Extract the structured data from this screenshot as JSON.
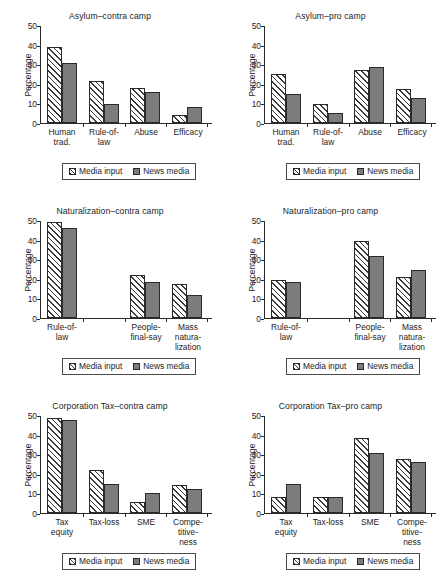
{
  "figure": {
    "ylabel": "Percentage",
    "yticks": [
      0,
      10,
      20,
      30,
      40,
      50
    ],
    "ylim": [
      0,
      50
    ],
    "legend": {
      "series1_label": "Media input",
      "series2_label": "News media",
      "series1_swatch": "hatched-swatch",
      "series2_swatch": "solid-gray-swatch"
    },
    "colors": {
      "hatch_line": "#3a3a3a",
      "solid_fill": "#7c7c7c",
      "axis": "#2a2a2a",
      "background": "#ffffff",
      "text": "#1c1c1c"
    }
  },
  "chart_data": [
    {
      "type": "bar",
      "title": "Asylum–contra camp",
      "xlabel": "",
      "ylabel": "Percentage",
      "ylim": [
        0,
        50
      ],
      "yticks": [
        0,
        10,
        20,
        30,
        40,
        50
      ],
      "grid": false,
      "legend_position": "below-axes",
      "categories": [
        "Human trad.",
        "Rule-of-law",
        "Abuse",
        "Efficacy"
      ],
      "category_lines": [
        [
          "Human",
          "trad."
        ],
        [
          "Rule-of-",
          "law"
        ],
        [
          "Abuse"
        ],
        [
          "Efficacy"
        ]
      ],
      "series": [
        {
          "name": "Media input",
          "values": [
            39.0,
            21.5,
            18.0,
            4.0
          ]
        },
        {
          "name": "News media",
          "values": [
            30.5,
            9.5,
            16.0,
            8.0
          ]
        }
      ]
    },
    {
      "type": "bar",
      "title": "Asylum–pro camp",
      "xlabel": "",
      "ylabel": "Percentage",
      "ylim": [
        0,
        50
      ],
      "yticks": [
        0,
        10,
        20,
        30,
        40,
        50
      ],
      "grid": false,
      "legend_position": "below-axes",
      "categories": [
        "Human trad.",
        "Rule-of-law",
        "Abuse",
        "Efficacy"
      ],
      "category_lines": [
        [
          "Human",
          "trad."
        ],
        [
          "Rule-of-",
          "law"
        ],
        [
          "Abuse"
        ],
        [
          "Efficacy"
        ]
      ],
      "series": [
        {
          "name": "Media input",
          "values": [
            25.0,
            9.5,
            27.0,
            17.5
          ]
        },
        {
          "name": "News media",
          "values": [
            15.0,
            5.0,
            28.5,
            13.0
          ]
        }
      ]
    },
    {
      "type": "bar",
      "title": "Naturalization–contra camp",
      "xlabel": "",
      "ylabel": "Percentage",
      "ylim": [
        0,
        50
      ],
      "yticks": [
        0,
        10,
        20,
        30,
        40,
        50
      ],
      "grid": false,
      "legend_position": "below-axes",
      "categories": [
        "Rule-of-law",
        "",
        "People-final-say",
        "Mass naturalization"
      ],
      "category_lines": [
        [
          "Rule-of-law"
        ],
        [
          ""
        ],
        [
          "People-",
          "final-say"
        ],
        [
          "Mass",
          "natura-",
          "lization"
        ]
      ],
      "series": [
        {
          "name": "Media input",
          "values": [
            49.0,
            null,
            22.0,
            17.5
          ]
        },
        {
          "name": "News media",
          "values": [
            46.0,
            null,
            18.5,
            11.5
          ]
        }
      ]
    },
    {
      "type": "bar",
      "title": "Naturalization–pro camp",
      "xlabel": "",
      "ylabel": "Percentage",
      "ylim": [
        0,
        50
      ],
      "yticks": [
        0,
        10,
        20,
        30,
        40,
        50
      ],
      "grid": false,
      "legend_position": "below-axes",
      "categories": [
        "Rule-of-law",
        "",
        "People-final-say",
        "Mass naturalization"
      ],
      "category_lines": [
        [
          "Rule-of-law"
        ],
        [
          ""
        ],
        [
          "People-",
          "final-say"
        ],
        [
          "Mass",
          "natura-",
          "lization"
        ]
      ],
      "series": [
        {
          "name": "Media input",
          "values": [
            19.5,
            null,
            39.5,
            21.0
          ]
        },
        {
          "name": "News media",
          "values": [
            18.5,
            null,
            31.5,
            24.5
          ]
        }
      ]
    },
    {
      "type": "bar",
      "title": "Corporation Tax–contra camp",
      "xlabel": "",
      "ylabel": "Percentage",
      "ylim": [
        0,
        50
      ],
      "yticks": [
        0,
        10,
        20,
        30,
        40,
        50
      ],
      "grid": false,
      "legend_position": "below-axes",
      "categories": [
        "Tax equity",
        "Tax-loss",
        "SME",
        "Competitiveness"
      ],
      "category_lines": [
        [
          "Tax",
          "equity"
        ],
        [
          "Tax-loss"
        ],
        [
          "SME"
        ],
        [
          "Compe-",
          "titive-",
          "ness"
        ]
      ],
      "series": [
        {
          "name": "Media input",
          "values": [
            48.5,
            22.0,
            5.5,
            14.5
          ]
        },
        {
          "name": "News media",
          "values": [
            47.5,
            15.0,
            10.0,
            12.0
          ]
        }
      ]
    },
    {
      "type": "bar",
      "title": "Corporation Tax–pro camp",
      "xlabel": "",
      "ylabel": "Percentage",
      "ylim": [
        0,
        50
      ],
      "yticks": [
        0,
        10,
        20,
        30,
        40,
        50
      ],
      "grid": false,
      "legend_position": "below-axes",
      "categories": [
        "Tax equity",
        "Tax-loss",
        "SME",
        "Competitiveness"
      ],
      "category_lines": [
        [
          "Tax",
          "equity"
        ],
        [
          "Tax-loss"
        ],
        [
          "SME"
        ],
        [
          "Compe-",
          "titive-",
          "ness"
        ]
      ],
      "series": [
        {
          "name": "Media input",
          "values": [
            8.0,
            8.0,
            38.5,
            27.5
          ]
        },
        {
          "name": "News media",
          "values": [
            15.0,
            8.0,
            30.5,
            26.0
          ]
        }
      ]
    }
  ]
}
